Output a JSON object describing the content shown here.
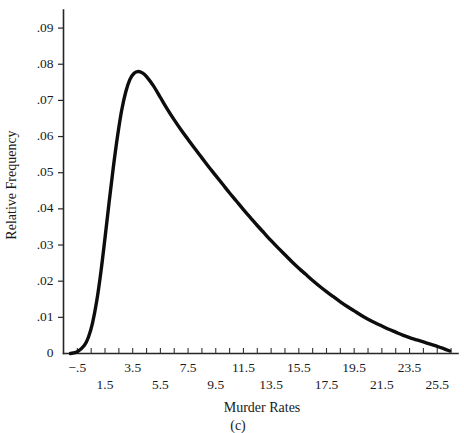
{
  "figure": {
    "caption": "(c)",
    "background_color": "#ffffff",
    "curve_color": "#0d0d0d",
    "axis_color": "#262626"
  },
  "chart_data": {
    "type": "line",
    "title": "",
    "subtitle": "",
    "xlabel": "Murder Rates",
    "ylabel": "Relative Frequency",
    "grid": false,
    "legend": "none",
    "xlim": [
      -1.5,
      27.0
    ],
    "ylim": [
      0,
      0.095
    ],
    "x_tick_values": [
      -1.5,
      -0.5,
      0.5,
      1.5,
      2.5,
      3.5,
      4.5,
      5.5,
      6.5,
      7.5,
      8.5,
      9.5,
      10.5,
      11.5,
      12.5,
      13.5,
      14.5,
      15.5,
      16.5,
      17.5,
      18.5,
      19.5,
      20.5,
      21.5,
      22.5,
      23.5,
      24.5,
      25.5,
      26.5
    ],
    "x_labeled_ticks": [
      {
        "value": -0.5,
        "label": "−.5",
        "row": "upper"
      },
      {
        "value": 1.5,
        "label": "1.5",
        "row": "lower"
      },
      {
        "value": 3.5,
        "label": "3.5",
        "row": "upper"
      },
      {
        "value": 5.5,
        "label": "5.5",
        "row": "lower"
      },
      {
        "value": 7.5,
        "label": "7.5",
        "row": "upper"
      },
      {
        "value": 9.5,
        "label": "9.5",
        "row": "lower"
      },
      {
        "value": 11.5,
        "label": "11.5",
        "row": "upper"
      },
      {
        "value": 13.5,
        "label": "13.5",
        "row": "lower"
      },
      {
        "value": 15.5,
        "label": "15.5",
        "row": "upper"
      },
      {
        "value": 17.5,
        "label": "17.5",
        "row": "lower"
      },
      {
        "value": 19.5,
        "label": "19.5",
        "row": "upper"
      },
      {
        "value": 21.5,
        "label": "21.5",
        "row": "lower"
      },
      {
        "value": 23.5,
        "label": "23.5",
        "row": "upper"
      },
      {
        "value": 25.5,
        "label": "25.5",
        "row": "lower"
      }
    ],
    "y_ticks": [
      {
        "value": 0.0,
        "label": "0"
      },
      {
        "value": 0.01,
        "label": ".01"
      },
      {
        "value": 0.02,
        "label": ".02"
      },
      {
        "value": 0.03,
        "label": ".03"
      },
      {
        "value": 0.04,
        "label": ".04"
      },
      {
        "value": 0.05,
        "label": ".05"
      },
      {
        "value": 0.06,
        "label": ".06"
      },
      {
        "value": 0.07,
        "label": ".07"
      },
      {
        "value": 0.08,
        "label": ".08"
      },
      {
        "value": 0.09,
        "label": ".09"
      }
    ],
    "x": [
      -1.0,
      -0.5,
      0.0,
      0.3,
      0.6,
      0.9,
      1.2,
      1.5,
      1.8,
      2.1,
      2.4,
      2.7,
      3.0,
      3.3,
      3.6,
      3.9,
      4.2,
      4.5,
      5.0,
      5.5,
      6.0,
      6.5,
      7.0,
      7.5,
      8.0,
      8.5,
      9.0,
      9.5,
      10.0,
      10.5,
      11.0,
      11.5,
      12.0,
      12.5,
      13.0,
      13.5,
      14.0,
      14.5,
      15.0,
      15.5,
      16.0,
      16.5,
      17.0,
      17.5,
      18.0,
      18.5,
      19.0,
      19.5,
      20.0,
      20.5,
      21.0,
      21.5,
      22.0,
      22.5,
      23.0,
      23.5,
      24.0,
      24.5,
      25.0,
      25.5,
      26.0,
      26.4
    ],
    "y": [
      0.0,
      0.0005,
      0.0022,
      0.0045,
      0.0085,
      0.0145,
      0.0225,
      0.032,
      0.042,
      0.0515,
      0.06,
      0.0672,
      0.0724,
      0.0758,
      0.0775,
      0.078,
      0.0776,
      0.0766,
      0.074,
      0.0708,
      0.0676,
      0.0646,
      0.0618,
      0.0592,
      0.0566,
      0.0541,
      0.0516,
      0.0492,
      0.0468,
      0.0444,
      0.0421,
      0.0398,
      0.0376,
      0.0354,
      0.0333,
      0.0312,
      0.0292,
      0.0273,
      0.0254,
      0.0236,
      0.0219,
      0.0202,
      0.0186,
      0.0171,
      0.0157,
      0.0143,
      0.013,
      0.0118,
      0.0106,
      0.0095,
      0.0085,
      0.0076,
      0.0067,
      0.0059,
      0.0051,
      0.0044,
      0.0038,
      0.0032,
      0.0026,
      0.002,
      0.0013,
      0.0007
    ],
    "peak": {
      "x": 3.9,
      "y": 0.078
    }
  }
}
